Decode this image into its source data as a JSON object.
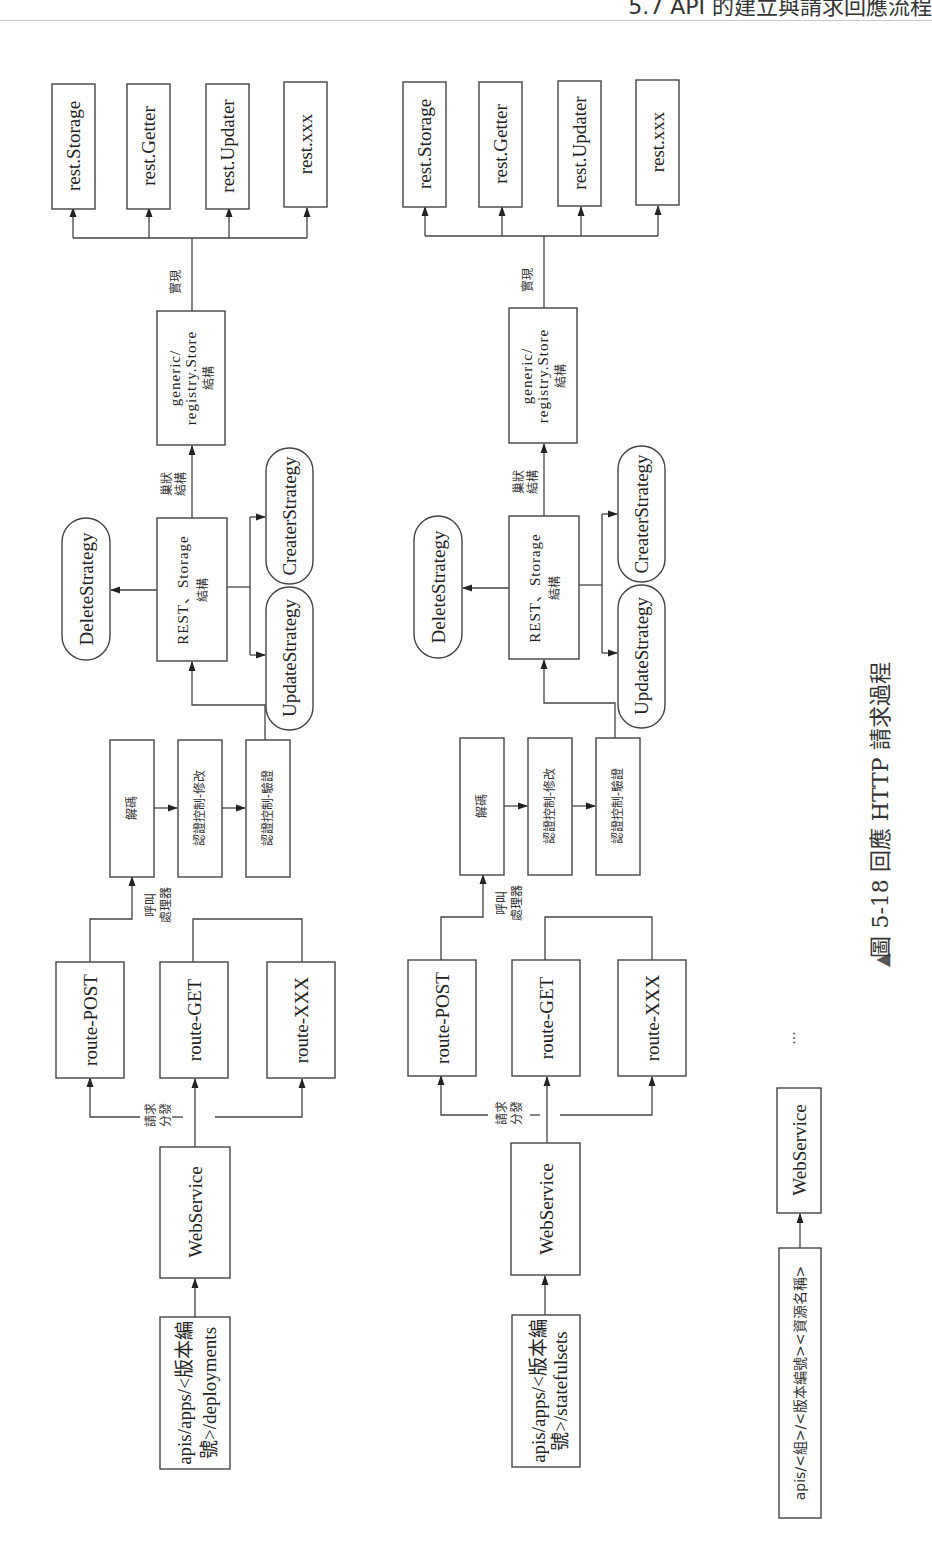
{
  "page_header": {
    "text": "5.7 API 的建立與請求回應流程"
  },
  "diagrams": [
    {
      "id": "deployments",
      "source": {
        "line1": "apis/apps/<版本編",
        "line2": "號>/deployments"
      },
      "webservice": "WebService",
      "dispatch_label": {
        "line1": "請求",
        "line2": "分發"
      },
      "routes": [
        "route-POST",
        "route-GET",
        "route-XXX"
      ],
      "handler_label": {
        "line1": "呼叫",
        "line2": "處理器"
      },
      "pipeline": [
        "解碼",
        "認證控制-修改",
        "認證控制-驗證"
      ],
      "rest_storage": {
        "line1": "REST、Storage",
        "line2": "結構"
      },
      "strategies": [
        "DeleteStrategy",
        "UpdateStrategy",
        "CreaterStrategy"
      ],
      "nested_label": {
        "line1": "巢狀",
        "line2": "結構"
      },
      "registry_store": {
        "line1": "generic/",
        "line2": "registry.Store",
        "line3": "結構"
      },
      "implements_label": "實現",
      "rest_interfaces": [
        "rest.Storage",
        "rest.Getter",
        "rest.Updater",
        "rest.xxx"
      ]
    },
    {
      "id": "statefulsets",
      "source": {
        "line1": "apis/apps/<版本編",
        "line2": "號>/statefulsets"
      },
      "webservice": "WebService",
      "dispatch_label": {
        "line1": "請求",
        "line2": "分發"
      },
      "routes": [
        "route-POST",
        "route-GET",
        "route-XXX"
      ],
      "handler_label": {
        "line1": "呼叫",
        "line2": "處理器"
      },
      "pipeline": [
        "解碼",
        "認證控制-修改",
        "認證控制-驗證"
      ],
      "rest_storage": {
        "line1": "REST、Storage",
        "line2": "結構"
      },
      "strategies": [
        "DeleteStrategy",
        "UpdateStrategy",
        "CreaterStrategy"
      ],
      "nested_label": {
        "line1": "巢狀",
        "line2": "結構"
      },
      "registry_store": {
        "line1": "generic/",
        "line2": "registry.Store",
        "line3": "結構"
      },
      "implements_label": "實現",
      "rest_interfaces": [
        "rest.Storage",
        "rest.Getter",
        "rest.Updater",
        "rest.xxx"
      ]
    }
  ],
  "generic_flow": {
    "source": "apis/<組>/<版本編號><資源名稱>",
    "webservice": "WebService",
    "ellipsis": "..."
  },
  "caption": {
    "marker": "▲",
    "text": "圖 5-18  回應 HTTP 請求過程"
  }
}
